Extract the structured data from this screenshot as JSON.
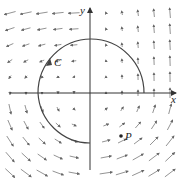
{
  "labels": {
    "x_axis": "x",
    "y_axis": "y",
    "curve": "C",
    "point": "P"
  },
  "colors": {
    "stroke": "#333333",
    "arrow": "#666666"
  },
  "origin": [
    90,
    93
  ],
  "spacing": 16
}
